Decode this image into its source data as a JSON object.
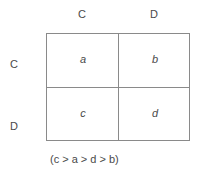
{
  "column_headers": [
    "C",
    "D"
  ],
  "row_headers": [
    "C",
    "D"
  ],
  "cells": [
    [
      "a",
      "b"
    ],
    [
      "c",
      "d"
    ]
  ],
  "caption": "(c > a > d > b)"
}
